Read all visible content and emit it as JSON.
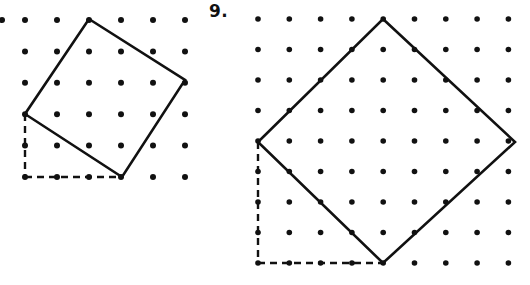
{
  "page": {
    "background_color": "#ffffff",
    "width": 530,
    "height": 285
  },
  "labels": {
    "problem_number_right": "9.",
    "problem_number_left": "."
  },
  "style": {
    "dot_color": "#111111",
    "line_color": "#111111",
    "dashed_color": "#111111",
    "dot_radius_left": 3.0,
    "dot_radius_right": 2.8,
    "shape_stroke_width": 2.6,
    "dash_stroke_width": 2.4,
    "dash_pattern": "7,5"
  },
  "figures": [
    {
      "id": "figure-left",
      "name": "left-geoboard",
      "grid": {
        "origin_x": 25,
        "origin_y": 20,
        "spacing_x": 32,
        "spacing_y": 31.4,
        "cols": 6,
        "rows": 6,
        "extra_dot_left": {
          "x": 2,
          "y": 20
        }
      },
      "shape": {
        "type": "square",
        "label": "tilted-square",
        "vertices_grid": [
          [
            2,
            0
          ],
          [
            5,
            2
          ],
          [
            3,
            5
          ],
          [
            0,
            3
          ]
        ],
        "vertices_px": [
          [
            89,
            19
          ],
          [
            185,
            80
          ],
          [
            122,
            177
          ],
          [
            25,
            114
          ]
        ]
      },
      "dashed_legs": {
        "vertical": {
          "x1": 25,
          "y1": 114,
          "x2": 25,
          "y2": 177
        },
        "horizontal": {
          "x1": 25,
          "y1": 177,
          "x2": 122,
          "y2": 177
        },
        "arrow_markers": true
      }
    },
    {
      "id": "figure-right",
      "name": "right-geoboard",
      "grid": {
        "origin_x": 258,
        "origin_y": 19,
        "spacing_x": 31.3,
        "spacing_y": 30.5,
        "cols": 9,
        "rows": 9
      },
      "shape": {
        "type": "square",
        "label": "diamond-square",
        "vertices_grid": [
          [
            4,
            0
          ],
          [
            8,
            4
          ],
          [
            4,
            8
          ],
          [
            0,
            4
          ]
        ],
        "vertices_px": [
          [
            383,
            19
          ],
          [
            515,
            142
          ],
          [
            383,
            263
          ],
          [
            258,
            142
          ]
        ]
      },
      "dashed_legs": {
        "vertical": {
          "x1": 258,
          "y1": 142,
          "x2": 258,
          "y2": 263
        },
        "horizontal": {
          "x1": 258,
          "y1": 263,
          "x2": 383,
          "y2": 263
        },
        "arrow_markers": true
      }
    }
  ]
}
